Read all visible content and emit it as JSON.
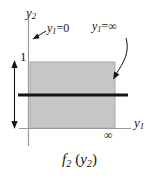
{
  "figure": {
    "name": "f2-of-y2-membership-figure",
    "caption": {
      "func": "f",
      "func_sub": "2",
      "arg": "y",
      "arg_sub": "2",
      "full": "f2 (y2)"
    },
    "background_color": "#ffffff",
    "ink_color": "#141414",
    "axis_color": "#9a9a9a",
    "region_fill": "#c6c6c6",
    "region_stroke": "#a8a8a8"
  },
  "axes": {
    "vertical": {
      "label": "y",
      "label_sub": "2",
      "x": 28,
      "y_top": 16,
      "y_bottom": 146
    },
    "horizontal": {
      "label": "y",
      "label_sub": "1",
      "y": 128,
      "x_left": 19,
      "x_right": 131,
      "end_marker": "∞"
    }
  },
  "region": {
    "name": "shaded-support-rectangle",
    "x": 30,
    "y": 62,
    "width": 85,
    "height": 66,
    "left_edge_label": "y1=0",
    "right_edge_label": "y1=∞"
  },
  "height_marker": {
    "label": "1",
    "x": 14,
    "y_top": 62,
    "y_bottom": 127
  },
  "value_line": {
    "name": "membership-value-line",
    "y": 95,
    "x_start": 18,
    "x_end": 128,
    "thickness": 3
  },
  "annotations": {
    "left_edge": {
      "var": "y",
      "var_sub": "1",
      "eq": "=0",
      "text": "y1=0",
      "arrow_from_x": 46,
      "arrow_from_y": 32,
      "arrow_to_x": 33,
      "arrow_to_y": 38
    },
    "right_edge": {
      "var": "y",
      "var_sub": "1",
      "eq": "=∞",
      "text": "y1=∞",
      "arrow_from_x": 125,
      "arrow_from_y": 38,
      "arrow_to_x": 114,
      "arrow_to_y": 80
    }
  }
}
